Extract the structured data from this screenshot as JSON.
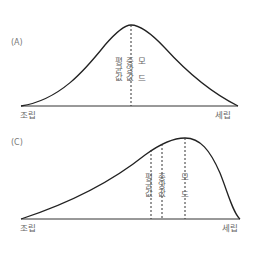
{
  "panels": [
    {
      "id": "A",
      "label": "(A)",
      "axis": {
        "left": "조립",
        "right": "세립"
      },
      "markers": {
        "mean": "평균값",
        "median": "중앙값",
        "mode": "모 드"
      },
      "shape": "symmetric"
    },
    {
      "id": "C",
      "label": "(C)",
      "axis": {
        "left": "조립",
        "right": "세립"
      },
      "markers": {
        "mean": "평균값",
        "median": "중앙값",
        "mode": "모 드"
      },
      "shape": "negatively-skewed"
    }
  ],
  "colors": {
    "curve": "#222222",
    "axis": "#333333",
    "text": "#666666"
  }
}
